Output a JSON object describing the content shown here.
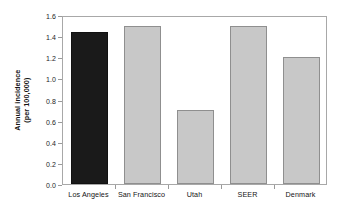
{
  "chart_data": {
    "type": "bar",
    "title": "",
    "subtitle": "",
    "xlabel": "",
    "ylabel": "Annual incidence (per 100,000)",
    "ylabel_line1": "Annual incidence",
    "ylabel_line2": "(per 100,000)",
    "categories": [
      "Los Angeles",
      "San Francisco",
      "Utah",
      "SEER",
      "Denmark"
    ],
    "values": [
      1.44,
      1.5,
      0.7,
      1.5,
      1.2
    ],
    "ylim": [
      0.0,
      1.6
    ],
    "ytick_step": 0.2,
    "ytick_labels": [
      "1.6",
      "1.4",
      "1.2",
      "1.0",
      "0.8",
      "0.6",
      "0.4",
      "0.2",
      "0.0"
    ],
    "ytick_values": [
      1.6,
      1.4,
      1.2,
      1.0,
      0.8,
      0.6,
      0.4,
      0.2,
      0.0
    ],
    "grid": false,
    "legend": "none",
    "bar_colors": [
      "#1a1a1a",
      "#c8c8c8",
      "#c8c8c8",
      "#c8c8c8",
      "#c8c8c8"
    ],
    "bar_edge_colors": [
      "#111111",
      "#8f8f8f",
      "#8f8f8f",
      "#8f8f8f",
      "#8f8f8f"
    ],
    "highlighted_category": "Los Angeles",
    "plot_border_color": "#a8a8a8",
    "background_color": "#ffffff",
    "text_color": "#141414"
  }
}
